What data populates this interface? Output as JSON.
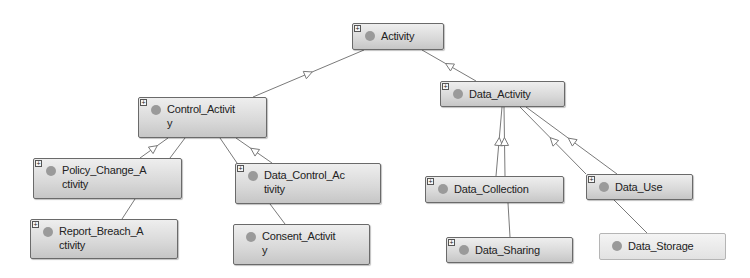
{
  "diagram": {
    "type": "class-hierarchy",
    "colors": {
      "node_border": "#6a6a6a",
      "node_fill_top": "#eeeeee",
      "node_fill_bottom": "#c6c6c6",
      "edge": "#7a7a7a",
      "dot": "#9a9a9a"
    },
    "nodes": [
      {
        "id": "activity",
        "label": "Activity",
        "expand": "+",
        "x": 352,
        "y": 23,
        "w": 92,
        "h": 27,
        "style": "normal"
      },
      {
        "id": "control_activity",
        "label": "Control_Activit y",
        "label_lines": [
          "Control_Activit",
          "y"
        ],
        "expand": "+",
        "x": 138,
        "y": 97,
        "w": 129,
        "h": 41,
        "style": "normal"
      },
      {
        "id": "data_activity",
        "label": "Data_Activity",
        "expand": "+",
        "x": 440,
        "y": 81,
        "w": 125,
        "h": 26,
        "style": "normal"
      },
      {
        "id": "policy_change_activity",
        "label": "Policy_Change_A ctivity",
        "label_lines": [
          "Policy_Change_A",
          "ctivity"
        ],
        "expand": "+",
        "x": 33,
        "y": 158,
        "w": 149,
        "h": 41,
        "style": "normal"
      },
      {
        "id": "data_control_activity",
        "label": "Data_Control_Ac tivity",
        "label_lines": [
          "Data_Control_Ac",
          "tivity"
        ],
        "expand": "+",
        "x": 235,
        "y": 163,
        "w": 146,
        "h": 41,
        "style": "normal"
      },
      {
        "id": "report_breach_activity",
        "label": "Report_Breach_A ctivity",
        "label_lines": [
          "Report_Breach_A",
          "ctivity"
        ],
        "expand": "+",
        "x": 30,
        "y": 219,
        "w": 148,
        "h": 40,
        "style": "normal"
      },
      {
        "id": "consent_activity",
        "label": "Consent_Activit y",
        "label_lines": [
          "Consent_Activit",
          "y"
        ],
        "expand": "",
        "x": 233,
        "y": 224,
        "w": 137,
        "h": 41,
        "style": "normal"
      },
      {
        "id": "data_collection",
        "label": "Data_Collection",
        "expand": "+",
        "x": 425,
        "y": 176,
        "w": 139,
        "h": 27,
        "style": "normal"
      },
      {
        "id": "data_use",
        "label": "Data_Use",
        "expand": "+",
        "x": 586,
        "y": 174,
        "w": 107,
        "h": 26,
        "style": "normal"
      },
      {
        "id": "data_sharing",
        "label": "Data_Sharing",
        "expand": "+",
        "x": 446,
        "y": 237,
        "w": 127,
        "h": 26,
        "style": "normal"
      },
      {
        "id": "data_storage",
        "label": "Data_Storage",
        "expand": "",
        "x": 599,
        "y": 233,
        "w": 127,
        "h": 27,
        "style": "light"
      }
    ],
    "edges": [
      {
        "from": "activity",
        "to": "control_activity",
        "x1": 364,
        "y1": 50,
        "x2": 253,
        "y2": 97,
        "arrow": true
      },
      {
        "from": "activity",
        "to": "data_activity",
        "x1": 422,
        "y1": 50,
        "x2": 476,
        "y2": 81,
        "arrow": true
      },
      {
        "from": "control_activity",
        "to": "policy_change_activity",
        "x1": 168,
        "y1": 138,
        "x2": 140,
        "y2": 158,
        "arrow": true
      },
      {
        "from": "control_activity",
        "to": "policy_change_activity",
        "x1": 185,
        "y1": 138,
        "x2": 170,
        "y2": 158,
        "arrow": false
      },
      {
        "from": "control_activity",
        "to": "data_control_activity",
        "x1": 220,
        "y1": 138,
        "x2": 237,
        "y2": 163,
        "arrow": false
      },
      {
        "from": "control_activity",
        "to": "data_control_activity",
        "x1": 236,
        "y1": 138,
        "x2": 272,
        "y2": 163,
        "arrow": true
      },
      {
        "from": "data_activity",
        "to": "data_collection",
        "x1": 502,
        "y1": 107,
        "x2": 496,
        "y2": 176,
        "arrow": true
      },
      {
        "from": "data_activity",
        "to": "data_collection",
        "x1": 504,
        "y1": 107,
        "x2": 505,
        "y2": 176,
        "arrow": true
      },
      {
        "from": "data_activity",
        "to": "data_use",
        "x1": 520,
        "y1": 107,
        "x2": 586,
        "y2": 174,
        "arrow": true
      },
      {
        "from": "data_activity",
        "to": "data_use",
        "x1": 526,
        "y1": 107,
        "x2": 617,
        "y2": 174,
        "arrow": true
      },
      {
        "from": "policy_change_activity",
        "to": "report_breach_activity",
        "x1": 135,
        "y1": 199,
        "x2": 122,
        "y2": 219,
        "arrow": false
      },
      {
        "from": "data_control_activity",
        "to": "consent_activity",
        "x1": 270,
        "y1": 204,
        "x2": 285,
        "y2": 224,
        "arrow": false
      },
      {
        "from": "data_collection",
        "to": "data_sharing",
        "x1": 508,
        "y1": 203,
        "x2": 510,
        "y2": 237,
        "arrow": false
      },
      {
        "from": "data_use",
        "to": "data_storage",
        "x1": 614,
        "y1": 200,
        "x2": 647,
        "y2": 233,
        "arrow": false
      }
    ]
  }
}
